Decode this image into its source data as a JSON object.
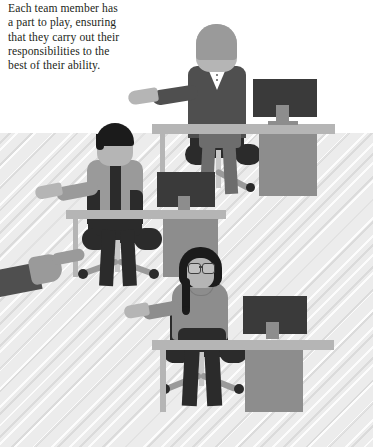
{
  "caption": {
    "text": "Each team member has\na part to play, ensuring\nthat they carry out their\nresponsibilities to the\nbest of their ability."
  },
  "scene": {
    "title": "office-team-illustration",
    "description": "Flat vector illustration of three office workers seated at desks with monitors, plus a hand pointing in from the left edge",
    "background": {
      "upper_band_color": "#ffffff",
      "lower_band_color": "#ececec",
      "lower_band_texture": "diagonal-hatch",
      "split_y": 133
    },
    "palette": {
      "ink": "#231f20",
      "near_black": "#1b1b1b",
      "dark_gray": "#3a3a3a",
      "mid_dark_gray": "#4f4f4f",
      "mid_gray": "#8d8d8d",
      "warm_gray": "#9a9a9a",
      "light_gray": "#b5b5b5",
      "lighter_gray": "#c8c8c8",
      "pale_gray": "#d9d9d9",
      "white": "#ffffff"
    },
    "workers": [
      {
        "id": "worker-top",
        "label": "Seated worker in dark suit, top of scene",
        "hair_color": "#9a9a9a",
        "skin_color": "#b5b5b5",
        "outfit_color": "#4f4f4f",
        "shirt_color": "#ffffff",
        "accessory": "v-neck-blouse-with-buttons",
        "arm_gesture": "pointing-left",
        "has_glasses": false,
        "has_braid": false,
        "has_necklace": false
      },
      {
        "id": "worker-middle",
        "label": "Seated worker with dark hair and striped top, middle left",
        "hair_color": "#1b1b1b",
        "skin_color": "#b5b5b5",
        "outfit_color": "#9a9a9a",
        "stripe_color": "#2b2b2b",
        "accessory": "open-dark-cardigan",
        "arm_gesture": "pointing-left",
        "has_glasses": false,
        "has_braid": false,
        "has_necklace": false
      },
      {
        "id": "worker-bottom",
        "label": "Seated worker with glasses, braid and necklace, bottom",
        "hair_color": "#1b1b1b",
        "skin_color": "#b5b5b5",
        "outfit_color": "#8d8d8d",
        "accessory": "glasses-and-necklace",
        "arm_gesture": "pointing-left",
        "has_glasses": true,
        "has_braid": true,
        "has_necklace": true
      }
    ],
    "pointing_hand": {
      "id": "pointing-hand-left",
      "label": "Hand and forearm entering from the left edge, index finger extended",
      "sleeve_color": "#4f4f4f",
      "hand_color": "#b5b5b5"
    },
    "furniture": {
      "desk_top_color": "#b5b5b5",
      "desk_leg_color": "#b5b5b5",
      "desk_pedestal_color": "#8d8d8d",
      "chair_color": "#2b2b2b",
      "chair_base_color": "#9a9a9a",
      "monitor_screen_color": "#3a3a3a",
      "monitor_stand_color": "#8d8d8d",
      "count": 3
    }
  }
}
